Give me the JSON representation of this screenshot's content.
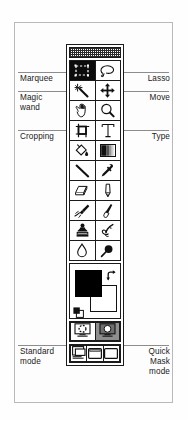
{
  "diagram": {
    "frame_border_color": "#b9b9b9",
    "leader_color": "#8c8c8c"
  },
  "labels": {
    "left": [
      {
        "text": "Marquee",
        "target": "rectangular-marquee-tool"
      },
      {
        "text": "Magic\nwand",
        "target": "magic-wand-tool"
      },
      {
        "text": "Cropping",
        "target": "crop-tool"
      },
      {
        "text": "Standard\nmode",
        "target": "standard-mode-button"
      }
    ],
    "right": [
      {
        "text": "Lasso",
        "target": "lasso-tool"
      },
      {
        "text": "Move",
        "target": "move-tool"
      },
      {
        "text": "Type",
        "target": "type-tool"
      },
      {
        "text": "Quick\nMask\nmode",
        "target": "quick-mask-mode-button"
      }
    ]
  },
  "toolbox": {
    "titlebar": "toolbox-title-bar",
    "rows": [
      {
        "left": {
          "name": "rectangular-marquee-tool",
          "icon": "marquee-icon",
          "selected": true
        },
        "right": {
          "name": "lasso-tool",
          "icon": "lasso-icon",
          "selected": false
        }
      },
      {
        "left": {
          "name": "magic-wand-tool",
          "icon": "magic-wand-icon",
          "selected": false
        },
        "right": {
          "name": "move-tool",
          "icon": "move-icon",
          "selected": false
        }
      },
      {
        "left": {
          "name": "hand-tool",
          "icon": "hand-icon",
          "selected": false
        },
        "right": {
          "name": "zoom-tool",
          "icon": "magnifier-icon",
          "selected": false
        }
      },
      {
        "left": {
          "name": "crop-tool",
          "icon": "crop-icon",
          "selected": false
        },
        "right": {
          "name": "type-tool",
          "icon": "type-t-icon",
          "selected": false
        }
      },
      {
        "left": {
          "name": "paint-bucket-tool",
          "icon": "paint-bucket-icon",
          "selected": false
        },
        "right": {
          "name": "gradient-tool",
          "icon": "gradient-icon",
          "selected": false
        }
      },
      {
        "left": {
          "name": "line-tool",
          "icon": "line-icon",
          "selected": false
        },
        "right": {
          "name": "eyedropper-tool",
          "icon": "eyedropper-icon",
          "selected": false
        }
      },
      {
        "left": {
          "name": "eraser-tool",
          "icon": "eraser-icon",
          "selected": false
        },
        "right": {
          "name": "pencil-tool",
          "icon": "pencil-icon",
          "selected": false
        }
      },
      {
        "left": {
          "name": "airbrush-tool",
          "icon": "airbrush-icon",
          "selected": false
        },
        "right": {
          "name": "paintbrush-tool",
          "icon": "paintbrush-icon",
          "selected": false
        }
      },
      {
        "left": {
          "name": "rubber-stamp-tool",
          "icon": "rubber-stamp-icon",
          "selected": false
        },
        "right": {
          "name": "smudge-tool",
          "icon": "smudge-finger-icon",
          "selected": false
        }
      },
      {
        "left": {
          "name": "blur-tool",
          "icon": "water-drop-icon",
          "selected": false
        },
        "right": {
          "name": "dodge-burn-tool",
          "icon": "dodge-lollipop-icon",
          "selected": false
        }
      }
    ],
    "colors": {
      "foreground": "#000000",
      "background": "#ffffff",
      "swap_icon": "swap-colors-icon",
      "default_icon": "default-colors-icon"
    },
    "modes": [
      {
        "name": "standard-mode-button",
        "icon": "standard-mode-icon",
        "selected": false
      },
      {
        "name": "quick-mask-mode-button",
        "icon": "quick-mask-icon",
        "selected": true
      }
    ],
    "screen_modes": [
      {
        "name": "standard-screen-mode-button",
        "icon": "standard-screen-icon",
        "selected": false
      },
      {
        "name": "full-screen-with-menu-button",
        "icon": "full-screen-menu-icon",
        "selected": false
      },
      {
        "name": "full-screen-button",
        "icon": "full-screen-icon",
        "selected": false
      }
    ]
  }
}
